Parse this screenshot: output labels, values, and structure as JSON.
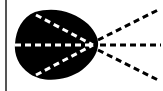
{
  "diagram": {
    "type": "light-cone-icon",
    "blob_color": "#000000",
    "ray_color_inside": "#ffffff",
    "ray_color_outside": "#000000",
    "background": "#ffffff",
    "border_color": "#555555",
    "focal_point": [
      93,
      45
    ],
    "rays": [
      {
        "name": "upper",
        "from": [
          33,
          14
        ],
        "to": [
          160,
          9
        ]
      },
      {
        "name": "middle",
        "from": [
          15,
          45
        ],
        "to": [
          160,
          45
        ]
      },
      {
        "name": "lower",
        "from": [
          33,
          76
        ],
        "to": [
          160,
          80
        ]
      }
    ]
  }
}
